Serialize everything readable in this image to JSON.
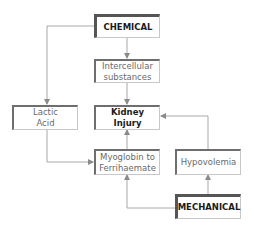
{
  "diagram": {
    "nodes": {
      "chemical": {
        "label": "CHEMICAL"
      },
      "intercellular": {
        "line1": "Intercellular",
        "line2": "substances"
      },
      "lactic": {
        "line1": "Lactic",
        "line2": "Acid"
      },
      "kidney": {
        "label": "Kidney Injury"
      },
      "myoglobin": {
        "line1": "Myoglobin to",
        "line2": "Ferrihaemate"
      },
      "hypovolemia": {
        "label": "Hypovolemia"
      },
      "mechanical": {
        "label": "MECHANICAL"
      }
    },
    "edges": [
      {
        "from": "CHEMICAL",
        "to": "Intercellular substances"
      },
      {
        "from": "CHEMICAL",
        "to": "Lactic Acid"
      },
      {
        "from": "Intercellular substances",
        "to": "Kidney Injury"
      },
      {
        "from": "Lactic Acid",
        "to": "Myoglobin to Ferrihaemate"
      },
      {
        "from": "Myoglobin to Ferrihaemate",
        "to": "Kidney Injury"
      },
      {
        "from": "Hypovolemia",
        "to": "Kidney Injury"
      },
      {
        "from": "MECHANICAL",
        "to": "Hypovolemia"
      },
      {
        "from": "MECHANICAL",
        "to": "Myoglobin to Ferrihaemate"
      }
    ],
    "colors": {
      "line": "#9a9a9a",
      "box_border_dark": "#6e6e6e",
      "text": "#6a6a6a",
      "bold_text": "#1a1a1a"
    }
  }
}
